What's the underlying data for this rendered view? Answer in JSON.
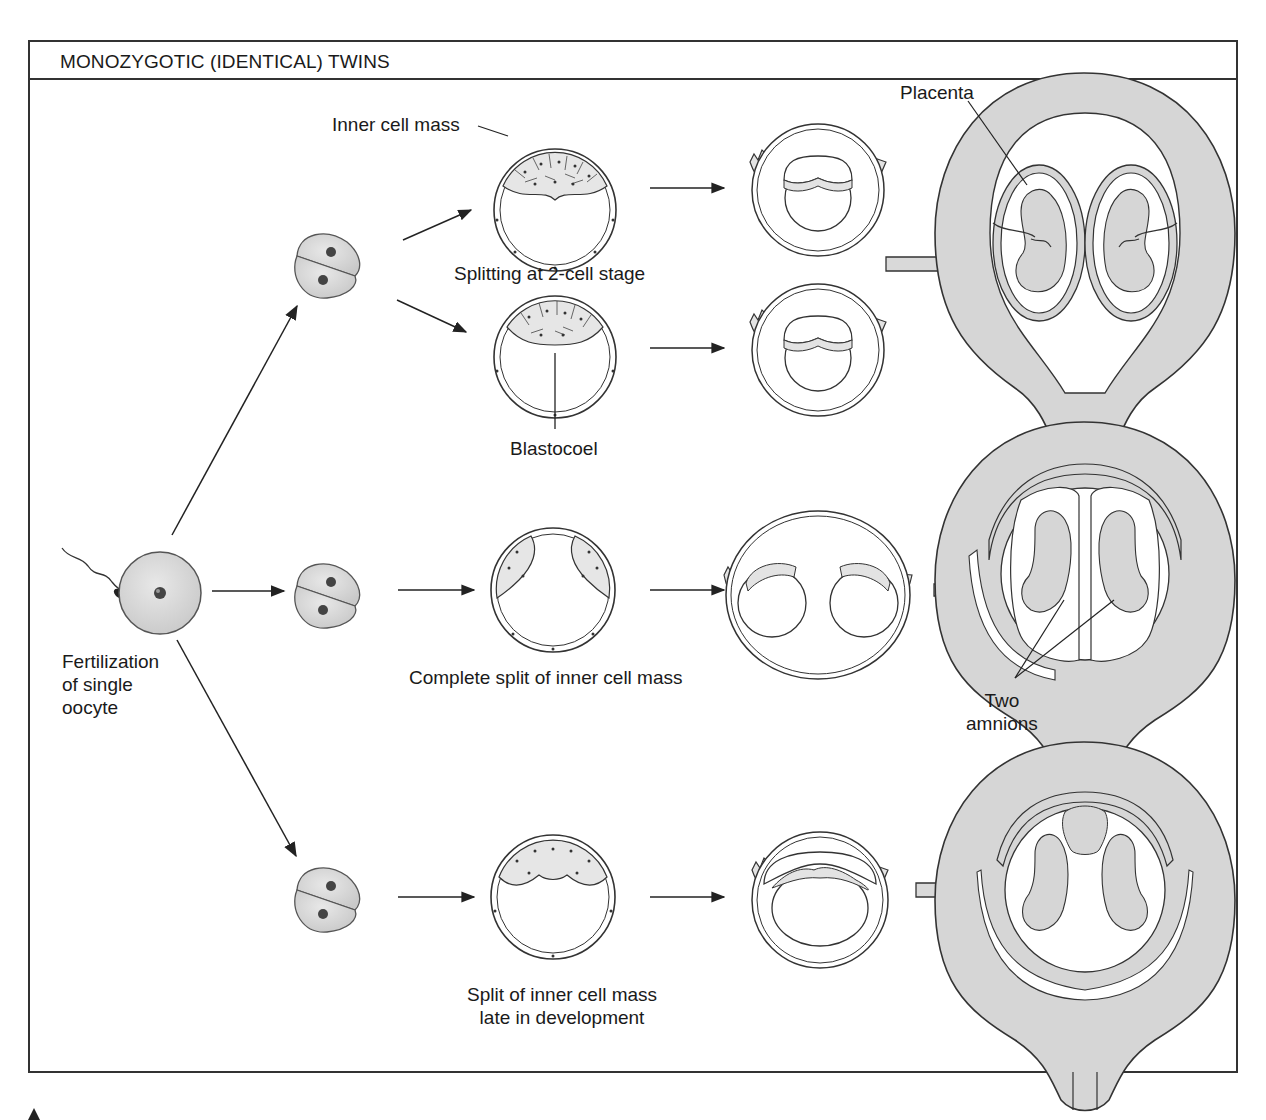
{
  "figure": {
    "title": "MONOZYGOTIC (IDENTICAL) TWINS",
    "colors": {
      "frame": "#333333",
      "cell_fill": "#d9d9d9",
      "uterus_fill": "#d6d6d6",
      "line": "#222222"
    }
  },
  "labels": {
    "inner_cell_mass": "Inner cell mass",
    "splitting_2cell": "Splitting at 2-cell stage",
    "blastocoel": "Blastocoel",
    "placenta": "Placenta",
    "fertilization_line1": "Fertilization",
    "fertilization_line2": "of single",
    "fertilization_line3": "oocyte",
    "complete_split": "Complete split of inner cell mass",
    "two_amnions_line1": "Two",
    "two_amnions_line2": "amnions",
    "late_split_line1": "Split of inner cell mass",
    "late_split_line2": "late in development"
  },
  "rows": [
    {
      "name": "splitting-at-2-cell-stage",
      "outcome": "two placentas, two amnions"
    },
    {
      "name": "complete-split-of-inner-cell-mass",
      "outcome": "one placenta, two amnions"
    },
    {
      "name": "late-split-of-inner-cell-mass",
      "outcome": "one placenta, one amnion"
    }
  ]
}
